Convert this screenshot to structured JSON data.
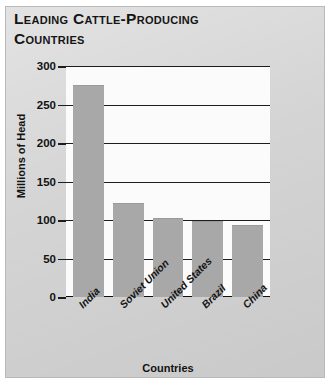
{
  "figure": {
    "title": "Leading Cattle-Producing Countries",
    "title_line_1": "Leading Cattle-Producing",
    "title_line_2": "Countries",
    "panel_color": "#d4d4d4",
    "plot_background": "#fbfbfb",
    "bar_color": "#a8a8a8",
    "gridline_color": "#1d1d1d"
  },
  "chart_data": {
    "type": "bar",
    "title": "Leading Cattle-Producing Countries",
    "categories": [
      "India",
      "Soviet Union",
      "United States",
      "Brazil",
      "China"
    ],
    "values": [
      275,
      122,
      103,
      99,
      93
    ],
    "xlabel": "Countries",
    "ylabel": "Millions of Head",
    "ylim": [
      0,
      300
    ],
    "ytick_values": [
      0,
      50,
      100,
      150,
      200,
      250,
      300
    ],
    "ytick_labels": [
      "0",
      "50",
      "100",
      "150",
      "200",
      "250",
      "300"
    ],
    "grid": true,
    "grid_axis": "y",
    "legend": null,
    "series": [
      {
        "name": "Cattle population",
        "values": [
          275,
          122,
          103,
          99,
          93
        ]
      }
    ]
  }
}
